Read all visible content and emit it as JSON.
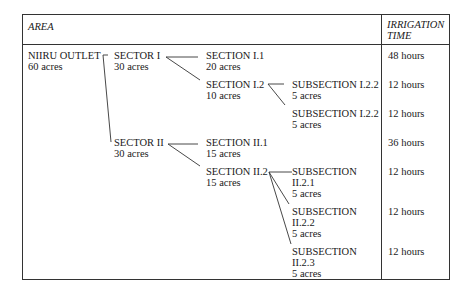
{
  "header": {
    "area": "AREA",
    "time_line1": "IRRIGATION",
    "time_line2": "TIME"
  },
  "outlet": {
    "name": "NIIRU OUTLET",
    "size": "60 acres"
  },
  "sectors": [
    {
      "name": "SECTOR I",
      "size": "30 acres"
    },
    {
      "name": "SECTOR II",
      "size": "30 acres"
    }
  ],
  "sections": [
    {
      "name": "SECTION I.1",
      "size": "20 acres",
      "time": "48 hours"
    },
    {
      "name": "SECTION I.2",
      "size": "10 acres"
    },
    {
      "name": "SECTION II.1",
      "size": "15 acres",
      "time": "36 hours"
    },
    {
      "name": "SECTION II.2",
      "size": "15 acres"
    }
  ],
  "subsections": [
    {
      "line1": "SUBSECTION I.2.2",
      "size": "5 acres",
      "time": "12 hours"
    },
    {
      "line1": "SUBSECTION I.2.2",
      "size": "5 acres",
      "time": "12 hours"
    },
    {
      "line1": "SUBSECTION",
      "line2": "II.2.1",
      "size": "5 acres",
      "time": "12 hours"
    },
    {
      "line1": "SUBSECTION",
      "line2": "II.2.2",
      "size": "5 acres",
      "time": "12 hours"
    },
    {
      "line1": "SUBSECTION",
      "line2": "II.2.3",
      "size": "5 acres",
      "time": "12 hours"
    }
  ]
}
